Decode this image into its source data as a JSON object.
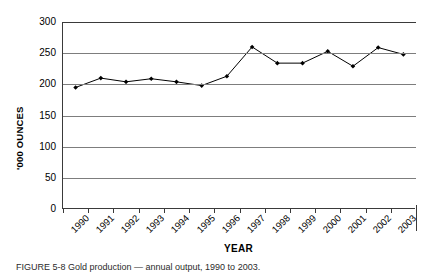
{
  "chart_data": {
    "type": "line",
    "title": "",
    "xlabel": "YEAR",
    "ylabel": "'000 OUNCES",
    "categories": [
      "1990",
      "1991",
      "1992",
      "1993",
      "1994",
      "1995",
      "1996",
      "1997",
      "1998",
      "1999",
      "2000",
      "2001",
      "2002",
      "2003"
    ],
    "values": [
      195,
      210,
      204,
      209,
      204,
      198,
      213,
      260,
      234,
      234,
      253,
      229,
      259,
      248
    ],
    "series": [
      {
        "name": "Production",
        "values": [
          195,
          210,
          204,
          209,
          204,
          198,
          213,
          260,
          234,
          234,
          253,
          229,
          259,
          248
        ]
      }
    ],
    "ylim": [
      0,
      300
    ],
    "yticks": [
      0,
      50,
      100,
      150,
      200,
      250,
      300
    ],
    "ytick_labels": [
      "0",
      "50",
      "100",
      "150",
      "200",
      "250",
      "300"
    ],
    "grid": "horizontal",
    "legend": "none",
    "marker": "filled-diamond",
    "line_color": "#000000",
    "marker_color": "#000000",
    "grid_color": "#7d7d7d",
    "axis_color": "#3a3a3a",
    "background": "#ffffff"
  },
  "caption": {
    "label": "FIGURE 5-8",
    "text": "FIGURE 5-8    Gold production — annual output, 1990 to 2003."
  }
}
